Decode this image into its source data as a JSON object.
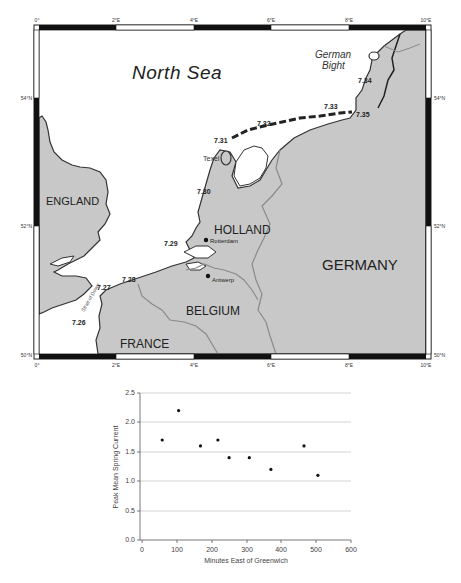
{
  "map": {
    "frame": {
      "top_lon_labels": [
        "0°",
        "2°E",
        "4°E",
        "6°E",
        "8°E",
        "10°E"
      ],
      "bottom_lon_labels": [
        "0°",
        "2°E",
        "4°E",
        "6°E",
        "8°E",
        "10°E"
      ],
      "left_lat_labels": [
        "54°N",
        "52°N",
        "50°N"
      ],
      "right_lat_labels": [
        "54°N",
        "52°N",
        "50°N"
      ]
    },
    "sea_labels": {
      "north_sea": "North Sea",
      "german_bight_line1": "German",
      "german_bight_line2": "Bight",
      "strait_of_dover": "Strait of Dover"
    },
    "country_labels": {
      "england": "ENGLAND",
      "holland": "HOLLAND",
      "belgium": "BELGIUM",
      "france": "FRANCE",
      "germany": "GERMANY"
    },
    "places": {
      "texel": "Texel",
      "rotterdam": "Rotterdam",
      "antwerp": "Antwerp"
    },
    "station_labels": [
      "7.26",
      "7.27",
      "7.28",
      "7.29",
      "7.30",
      "7.31",
      "7.32",
      "7.33",
      "7.34",
      "7.35"
    ],
    "colors": {
      "land": "#c8c8c8",
      "sea": "#ffffff",
      "coast": "#333333",
      "border": "#8a8a8a"
    }
  },
  "chart_data": {
    "type": "scatter",
    "title": "",
    "xlabel": "Minutes East of Greenwich",
    "ylabel": "Peak Mean Spring Current",
    "x": [
      58,
      105,
      168,
      218,
      250,
      308,
      370,
      465,
      505
    ],
    "y": [
      1.7,
      2.2,
      1.6,
      1.7,
      1.4,
      1.4,
      1.2,
      1.6,
      1.1
    ],
    "xlim": [
      0,
      600
    ],
    "ylim": [
      0.0,
      2.5
    ],
    "x_ticks": [
      "0",
      "100",
      "200",
      "300",
      "400",
      "500",
      "600"
    ],
    "y_ticks": [
      "0.0",
      "0.5",
      "1.0",
      "1.5",
      "2.0",
      "2.5"
    ],
    "grid": "horizontal",
    "legend": "none"
  }
}
